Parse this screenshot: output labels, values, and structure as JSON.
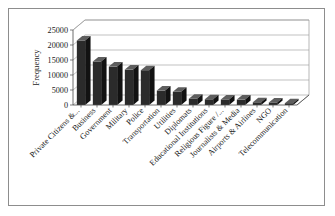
{
  "figure": {
    "border_color": "#8d8d8d",
    "background": "#ffffff"
  },
  "chart_data": {
    "type": "bar",
    "title": "",
    "xlabel": "",
    "ylabel": "Frequency",
    "ylim": [
      0,
      25000
    ],
    "ytick_labels": [
      "0",
      "5000",
      "10000",
      "15000",
      "20000",
      "25000"
    ],
    "ytick_values": [
      0,
      5000,
      10000,
      15000,
      20000,
      25000
    ],
    "grid": true,
    "legend": "none",
    "style": "3d-column",
    "bar_color": "#2b2b2b",
    "categories": [
      "Private Citizens &...",
      "Business",
      "Government",
      "Military",
      "Police",
      "Transportation",
      "Utilities",
      "Diplomats",
      "Educational Institutions",
      "Religious Figure /...",
      "Journalists & Media",
      "Airports & Airlines",
      "NGO",
      "Telecommunication"
    ],
    "values": [
      21500,
      14500,
      12800,
      11800,
      11600,
      4800,
      4400,
      2100,
      1900,
      1850,
      1800,
      900,
      850,
      600
    ]
  }
}
